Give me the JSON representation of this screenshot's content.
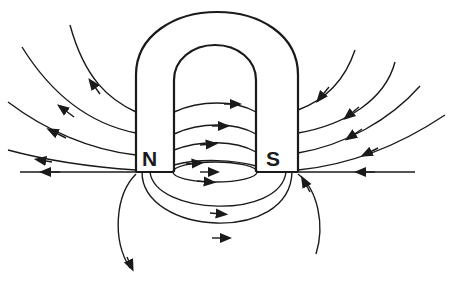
{
  "diagram": {
    "poles": {
      "north_label": "N",
      "south_label": "S"
    },
    "colors": {
      "line": "#1a1a1a",
      "background": "#ffffff"
    },
    "icons": [
      "arrowhead-icon"
    ]
  }
}
